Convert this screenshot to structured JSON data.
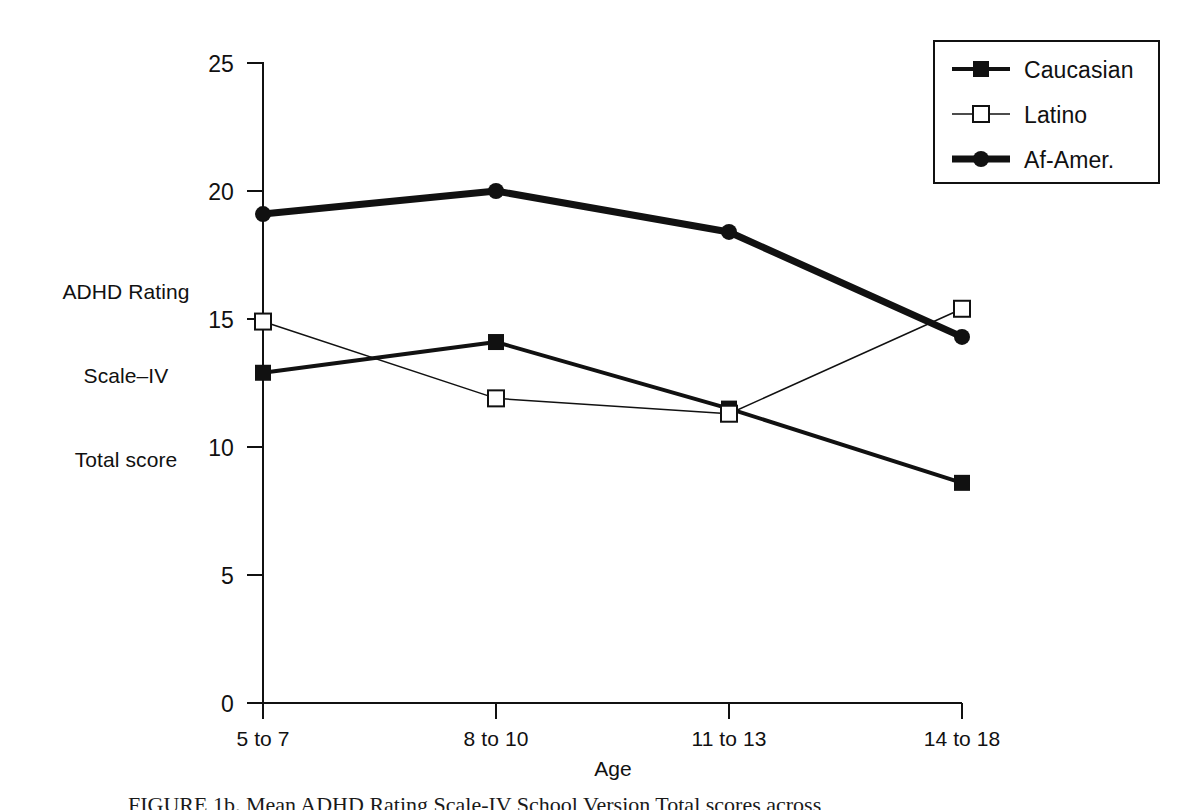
{
  "figure": {
    "background_color": "#ffffff",
    "ink_color": "#111111",
    "caption_text": "FIGURE 1b. Mean ADHD Rating Scale-IV School Version Total scores across"
  },
  "axes": {
    "y_label_lines": [
      "ADHD Rating",
      "Scale–IV",
      "Total score"
    ],
    "x_label": "Age",
    "y_ticks": [
      "0",
      "5",
      "10",
      "15",
      "20",
      "25"
    ],
    "x_ticks": [
      "5 to 7",
      "8 to 10",
      "11 to 13",
      "14 to 18"
    ],
    "y_min": 0,
    "y_max": 25
  },
  "legend": {
    "items": [
      {
        "label": "Caucasian",
        "marker": "filled-square",
        "line_width": 4,
        "color": "#111111"
      },
      {
        "label": "Latino",
        "marker": "open-square",
        "line_width": 1.5,
        "color": "#111111"
      },
      {
        "label": "Af-Amer.",
        "marker": "filled-circle",
        "line_width": 7,
        "color": "#111111"
      }
    ]
  },
  "chart_data": {
    "type": "line",
    "title": "",
    "xlabel": "Age",
    "ylabel": "ADHD Rating Scale–IV Total score",
    "categories": [
      "5 to 7",
      "8 to 10",
      "11 to 13",
      "14 to 18"
    ],
    "ylim": [
      0,
      25
    ],
    "yticks": [
      0,
      5,
      10,
      15,
      20,
      25
    ],
    "grid": false,
    "legend_position": "top-right",
    "series": [
      {
        "name": "Caucasian",
        "marker": "filled-square",
        "line_width": 4,
        "color": "#111111",
        "values": [
          12.9,
          14.1,
          11.5,
          8.6
        ]
      },
      {
        "name": "Latino",
        "marker": "open-square",
        "line_width": 1.5,
        "color": "#111111",
        "values": [
          14.9,
          11.9,
          11.3,
          15.4
        ]
      },
      {
        "name": "Af-Amer.",
        "marker": "filled-circle",
        "line_width": 7,
        "color": "#111111",
        "values": [
          19.1,
          20.0,
          18.4,
          14.3
        ]
      }
    ]
  }
}
